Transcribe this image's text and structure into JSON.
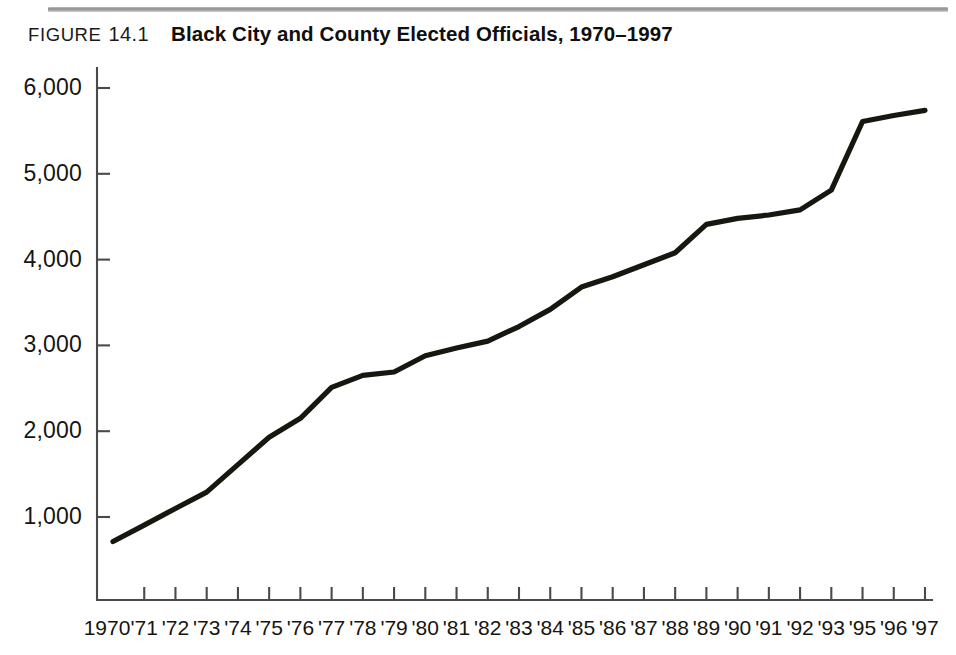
{
  "figure": {
    "label": "FIGURE",
    "number": "14.1",
    "title": "Black City and County Elected Officials, 1970–1997"
  },
  "chart_data": {
    "type": "line",
    "title": "Black City and County Elected Officials, 1970–1997",
    "subtitle": "",
    "xlabel": "",
    "ylabel": "",
    "grid": false,
    "legend": "none",
    "xlim": [
      1970,
      1997
    ],
    "ylim": [
      0,
      6000
    ],
    "yticks": [
      1000,
      2000,
      3000,
      4000,
      5000,
      6000
    ],
    "ytick_labels": [
      "1,000",
      "2,000",
      "3,000",
      "4,000",
      "5,000",
      "6,000"
    ],
    "xtick_labels": [
      "1970",
      "'71",
      "'72",
      "'73",
      "'74",
      "'75",
      "'76",
      "'77",
      "'78",
      "'79",
      "'80",
      "'81",
      "'82",
      "'83",
      "'84",
      "'85",
      "'86",
      "'87",
      "'88",
      "'89",
      "'90",
      "'91",
      "'92",
      "'93",
      "'95",
      "'96",
      "'97"
    ],
    "series": [
      {
        "name": "Black city and county elected officials",
        "color": "#17160f",
        "x": [
          1970,
          1971,
          1972,
          1973,
          1974,
          1975,
          1976,
          1977,
          1978,
          1979,
          1980,
          1981,
          1982,
          1983,
          1984,
          1985,
          1986,
          1987,
          1988,
          1989,
          1990,
          1991,
          1992,
          1993,
          1995,
          1996,
          1997
        ],
        "values": [
          715,
          905,
          1100,
          1290,
          1610,
          1930,
          2150,
          2510,
          2650,
          2690,
          2880,
          2970,
          3050,
          3220,
          3420,
          3680,
          3800,
          3940,
          4080,
          4410,
          4480,
          4520,
          4580,
          4810,
          5610,
          5680,
          5740
        ]
      }
    ]
  }
}
